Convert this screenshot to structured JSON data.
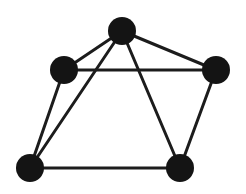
{
  "diagram": {
    "type": "graph",
    "directed": false,
    "colors": {
      "node": "#141414",
      "edge": "#1c1c1c",
      "background": "#ffffff"
    },
    "node_radius": 14,
    "edge_width": 3,
    "nodes": [
      {
        "id": "top",
        "x": 122,
        "y": 31
      },
      {
        "id": "left",
        "x": 64,
        "y": 70
      },
      {
        "id": "right",
        "x": 216,
        "y": 70
      },
      {
        "id": "bottom-left",
        "x": 30,
        "y": 168
      },
      {
        "id": "bottom-right",
        "x": 180,
        "y": 168
      }
    ],
    "edges": [
      [
        "top",
        "left"
      ],
      [
        "top",
        "right"
      ],
      [
        "left",
        "right"
      ],
      [
        "left",
        "bottom-left"
      ],
      [
        "top",
        "bottom-left"
      ],
      [
        "top",
        "bottom-right"
      ],
      [
        "right",
        "bottom-right"
      ],
      [
        "bottom-left",
        "bottom-right"
      ]
    ]
  }
}
